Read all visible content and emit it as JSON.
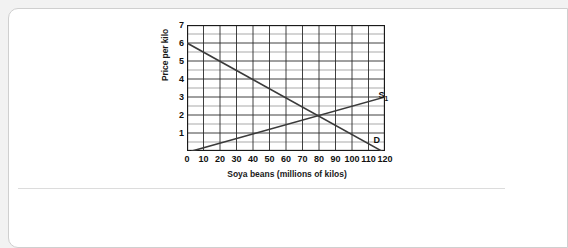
{
  "card": {
    "name": "worksheet-card"
  },
  "chart_data": {
    "type": "line",
    "title": "",
    "xlabel": "Soya beans (millions of kilos)",
    "ylabel": "Price per kilo",
    "xlim": [
      0,
      120
    ],
    "ylim": [
      0,
      7
    ],
    "xticks": [
      0,
      10,
      20,
      30,
      40,
      50,
      60,
      70,
      80,
      90,
      100,
      110,
      120
    ],
    "yticks": [
      1,
      2,
      3,
      4,
      5,
      6,
      7
    ],
    "grid": "major-and-minor",
    "grid_x_step": 10,
    "grid_y_step": 0.5,
    "legend": "inline-labels",
    "equilibrium": {
      "x": 80,
      "y": 2
    },
    "series": [
      {
        "name": "D",
        "label": "D",
        "role": "demand",
        "points": [
          [
            0,
            6
          ],
          [
            118,
            0
          ]
        ],
        "color": "#3a3a3a"
      },
      {
        "name": "S1",
        "label": "S",
        "label_sub": "1",
        "role": "supply",
        "points": [
          [
            3,
            0
          ],
          [
            120,
            3
          ]
        ],
        "color": "#3a3a3a"
      }
    ]
  }
}
